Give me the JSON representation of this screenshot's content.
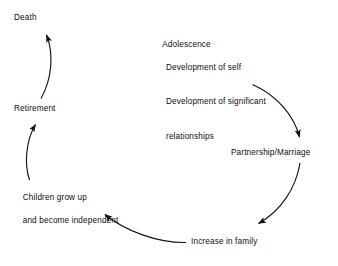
{
  "diagram": {
    "type": "cycle",
    "stroke_color": "#121212",
    "background_color": "#ffffff",
    "nodes": [
      {
        "id": "adolescence",
        "label": "Adolescence",
        "sub_items": [
          "Development of self",
          "Development of significant",
          "relationships"
        ]
      },
      {
        "id": "partnership",
        "label": "Partnership/Marriage",
        "sub_items": []
      },
      {
        "id": "increase-in-family",
        "label": "Increase in family",
        "sub_items": []
      },
      {
        "id": "children-grow-up",
        "label": "Children grow up",
        "sub_items": [
          "and become independent"
        ]
      },
      {
        "id": "retirement",
        "label": "Retirement",
        "sub_items": []
      },
      {
        "id": "death",
        "label": "Death",
        "sub_items": []
      }
    ],
    "edges": [
      {
        "from": "adolescence",
        "to": "partnership"
      },
      {
        "from": "partnership",
        "to": "increase-in-family"
      },
      {
        "from": "increase-in-family",
        "to": "children-grow-up"
      },
      {
        "from": "children-grow-up",
        "to": "retirement"
      },
      {
        "from": "retirement",
        "to": "death"
      }
    ]
  },
  "labels": {
    "death": "Death",
    "retirement": "Retirement",
    "children_line1": "Children grow up",
    "children_line2": "and become independent",
    "increase_in_family": "Increase in family",
    "partnership": "Partnership/Marriage",
    "adolescence": "Adolescence",
    "adolescence_sub1": "Development of self",
    "adolescence_sub2": "Development of significant",
    "adolescence_sub3": "relationships"
  }
}
